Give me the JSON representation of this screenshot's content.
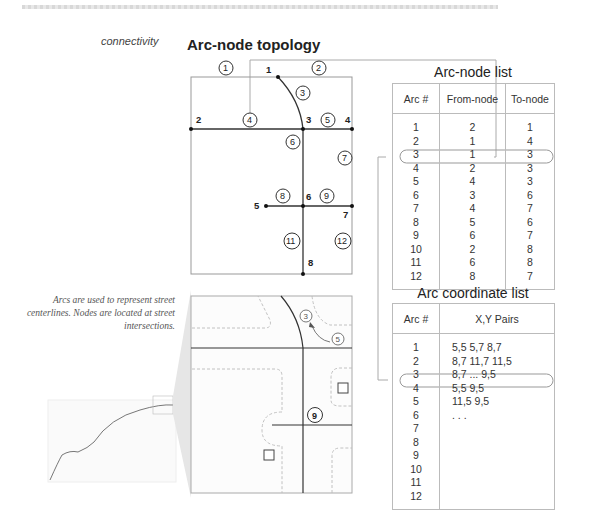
{
  "header": {
    "side_label": "connectivity",
    "title": "Arc-node topology"
  },
  "caption": "Arcs are used to represent street centerlines.  Nodes are located at street intersections.",
  "topology_diagram": {
    "nodes": [
      {
        "id": "1",
        "x": 278,
        "y": 77
      },
      {
        "id": "2",
        "x": 191,
        "y": 129
      },
      {
        "id": "3",
        "x": 303,
        "y": 129
      },
      {
        "id": "4",
        "x": 352,
        "y": 129
      },
      {
        "id": "5",
        "x": 266,
        "y": 206
      },
      {
        "id": "6",
        "x": 303,
        "y": 206
      },
      {
        "id": "7",
        "x": 352,
        "y": 206
      },
      {
        "id": "8",
        "x": 303,
        "y": 274
      }
    ],
    "arc_labels": [
      {
        "id": "1",
        "x": 226,
        "y": 69
      },
      {
        "id": "2",
        "x": 319,
        "y": 69
      },
      {
        "id": "3",
        "x": 303,
        "y": 93
      },
      {
        "id": "4",
        "x": 250,
        "y": 120
      },
      {
        "id": "5",
        "x": 328,
        "y": 120
      },
      {
        "id": "6",
        "x": 293,
        "y": 142
      },
      {
        "id": "7",
        "x": 345,
        "y": 158
      },
      {
        "id": "8",
        "x": 283,
        "y": 196
      },
      {
        "id": "9",
        "x": 327,
        "y": 196
      },
      {
        "id": "11",
        "x": 292,
        "y": 241
      },
      {
        "id": "12",
        "x": 343,
        "y": 241
      }
    ]
  },
  "arc_node_list": {
    "title": "Arc-node list",
    "columns": [
      "Arc #",
      "From-node",
      "To-node"
    ],
    "rows": [
      [
        "1",
        "2",
        "1"
      ],
      [
        "2",
        "1",
        "4"
      ],
      [
        "3",
        "1",
        "3"
      ],
      [
        "4",
        "2",
        "3"
      ],
      [
        "5",
        "4",
        "3"
      ],
      [
        "6",
        "3",
        "6"
      ],
      [
        "7",
        "4",
        "7"
      ],
      [
        "8",
        "5",
        "6"
      ],
      [
        "9",
        "6",
        "7"
      ],
      [
        "10",
        "2",
        "8"
      ],
      [
        "11",
        "6",
        "8"
      ],
      [
        "12",
        "8",
        "7"
      ]
    ],
    "highlighted_row": "4"
  },
  "arc_coordinate_list": {
    "title": "Arc coordinate list",
    "columns": [
      "Arc #",
      "X,Y Pairs"
    ],
    "rows": [
      [
        "1",
        "5,5  5,7  8,7"
      ],
      [
        "2",
        "8,7  11,7  11,5"
      ],
      [
        "3",
        "8,7 ... 9,5"
      ],
      [
        "4",
        "5,5  9,5"
      ],
      [
        "5",
        "11,5  9,5"
      ],
      [
        "6",
        ". . ."
      ],
      [
        "7",
        ""
      ],
      [
        "8",
        ""
      ],
      [
        "9",
        ""
      ],
      [
        "10",
        ""
      ],
      [
        "11",
        ""
      ],
      [
        "12",
        ""
      ]
    ],
    "highlighted_row": "4"
  },
  "street_map": {
    "arc_labels": [
      "3",
      "5",
      "9"
    ]
  }
}
